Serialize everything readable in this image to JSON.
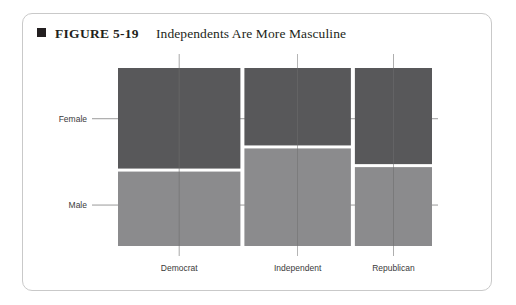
{
  "figure": {
    "bullet_icon": "square-bullet-icon",
    "number": "FIGURE 5-19",
    "title": "Independents Are More Masculine"
  },
  "chart_data": {
    "type": "bar",
    "subtype": "mosaic",
    "title": "Independents Are More Masculine",
    "xlabel": "",
    "ylabel": "",
    "grid": false,
    "legend": "none",
    "categories": [
      "Democrat",
      "Independent",
      "Republican"
    ],
    "y_categories": [
      "Female",
      "Male"
    ],
    "category_widths_pct": [
      40.0,
      34.8,
      25.2
    ],
    "series": [
      {
        "name": "Female",
        "color": "#58585a",
        "values": [
          56.5,
          43.5,
          54.0
        ]
      },
      {
        "name": "Male",
        "color": "#8b8b8d",
        "values": [
          43.5,
          56.5,
          46.0
        ]
      }
    ],
    "y_tick_labels": [
      "Female",
      "Male"
    ],
    "y_tick_positions_pct": [
      71.5,
      23.0
    ],
    "x_tick_labels": [
      "Democrat",
      "Independent",
      "Republican"
    ],
    "axis_line_color": "#6f6f6f",
    "gap_color": "#ffffff"
  },
  "colors": {
    "female": "#58585a",
    "male": "#8b8b8d",
    "frame": "#c9c9c9",
    "text": "#231f20",
    "tick": "#6f6f6f"
  }
}
